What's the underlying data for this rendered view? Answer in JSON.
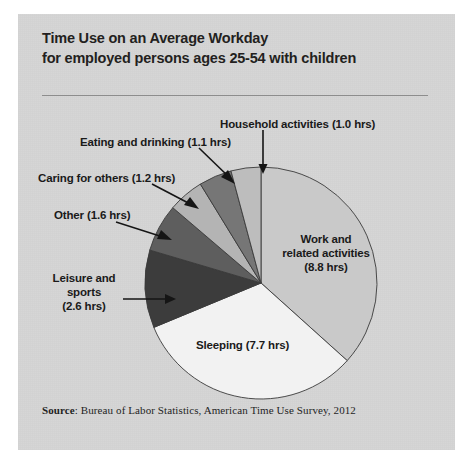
{
  "page": {
    "background": "#ffffff",
    "panel_color": "#d6d6d6"
  },
  "title": {
    "line1": "Time Use on an Average Workday",
    "line2": "for employed persons ages 25-54 with children"
  },
  "source": {
    "label": "Source",
    "separator": ": ",
    "text": "Bureau of Labor Statistics, American Time Use Survey, 2012"
  },
  "chart_data": {
    "type": "pie",
    "title": "Time Use on an Average Workday for employed persons ages 25-54 with children",
    "unit": "hrs",
    "total": 24.0,
    "start_angle_deg": 0,
    "direction": "clockwise",
    "legend": "none (direct labels with leader lines)",
    "categories": [
      "Work and related activities",
      "Sleeping",
      "Leisure and sports",
      "Other",
      "Caring for others",
      "Eating and drinking",
      "Household activities"
    ],
    "values": [
      8.8,
      7.7,
      2.6,
      1.6,
      1.2,
      1.1,
      1.0
    ],
    "slices": [
      {
        "name": "Work and related activities",
        "value": 8.8,
        "label": "Work and",
        "label_line2": "related activities",
        "label_value": "(8.8 hrs)",
        "color": "#c9c9c9",
        "label_placement": "inside"
      },
      {
        "name": "Sleeping",
        "value": 7.7,
        "label": "Sleeping (7.7 hrs)",
        "color": "#f2f2f2",
        "label_placement": "inside"
      },
      {
        "name": "Leisure and sports",
        "value": 2.6,
        "label": "Leisure and sports",
        "label_line2": "(2.6 hrs)",
        "color": "#3c3c3c",
        "label_placement": "outside-left"
      },
      {
        "name": "Other",
        "value": 1.6,
        "label": "Other (1.6 hrs)",
        "color": "#5e5e5e",
        "label_placement": "outside-left"
      },
      {
        "name": "Caring for others",
        "value": 1.2,
        "label": "Caring for others (1.2 hrs)",
        "color": "#b4b4b4",
        "label_placement": "outside-left"
      },
      {
        "name": "Eating and drinking",
        "value": 1.1,
        "label": "Eating and drinking (1.1 hrs)",
        "color": "#767676",
        "label_placement": "outside-top"
      },
      {
        "name": "Household activities",
        "value": 1.0,
        "label": "Household activities  (1.0 hrs)",
        "color": "#bdbdbd",
        "label_placement": "outside-top"
      }
    ]
  }
}
